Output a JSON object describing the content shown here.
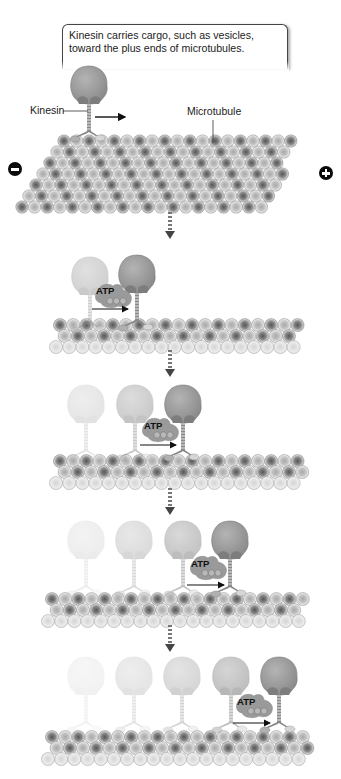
{
  "caption": {
    "text": "Kinesin carries cargo, such as vesicles, toward the plus ends of microtubules."
  },
  "labels": {
    "kinesin": "Kinesin",
    "microtubule": "Microtubule",
    "minus_end": "minus-end-icon",
    "plus_end": "plus-end-icon",
    "atp": "ATP"
  },
  "stages": [
    {
      "index": 1,
      "kinesin_count": 1,
      "has_atp": false
    },
    {
      "index": 2,
      "kinesin_count": 2,
      "has_atp": true
    },
    {
      "index": 3,
      "kinesin_count": 3,
      "has_atp": true
    },
    {
      "index": 4,
      "kinesin_count": 4,
      "has_atp": true
    },
    {
      "index": 5,
      "kinesin_count": 5,
      "has_atp": true
    }
  ],
  "colors": {
    "background": "#ffffff",
    "head": "#9a9a9a",
    "tubulin_dark": "#6a6a6a",
    "tubulin_light": "#c8c8c8",
    "pole": "#0a0a0a"
  },
  "atp_labels": [
    "ATP",
    "ATP",
    "ATP",
    "ATP"
  ]
}
